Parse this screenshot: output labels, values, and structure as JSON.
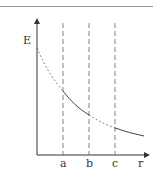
{
  "diagram": {
    "y_axis_label": "E",
    "x_axis_label": "r",
    "markers": [
      "a",
      "b",
      "c"
    ],
    "curve": {
      "description": "Decreasing field strength E vs r; dotted outside, solid in a-b and beyond c",
      "segments": [
        {
          "from": "0",
          "to": "a",
          "style": "dotted"
        },
        {
          "from": "a",
          "to": "b",
          "style": "solid"
        },
        {
          "from": "b",
          "to": "c",
          "style": "dotted"
        },
        {
          "from": "c",
          "to": "end",
          "style": "solid"
        }
      ]
    },
    "colors": {
      "axis": "#333333",
      "curve": "#444444",
      "guides": "#666666"
    }
  }
}
